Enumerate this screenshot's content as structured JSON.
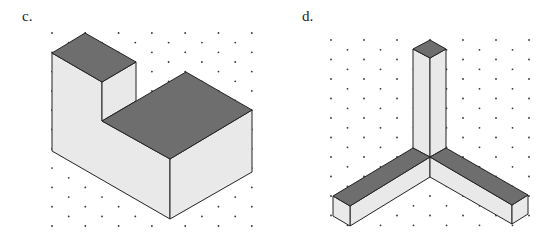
{
  "figures": [
    {
      "label": "c.",
      "description": "Isometric drawing of an L-shaped solid: a tall narrow block at the back-left joined to a wider, lower block in front-right, drawn on isometric dot paper",
      "top_color": "#6e6e6e",
      "side_color": "#e9e9e9"
    },
    {
      "label": "d.",
      "description": "Isometric drawing of three square rods meeting at a corner: one vertical rod and two horizontal rods extending left-forward and right-forward, drawn on isometric dot paper",
      "top_color": "#6e6e6e",
      "side_color": "#e9e9e9"
    }
  ],
  "grid": {
    "type": "isometric-dot-paper",
    "dot_color": "#333333"
  }
}
